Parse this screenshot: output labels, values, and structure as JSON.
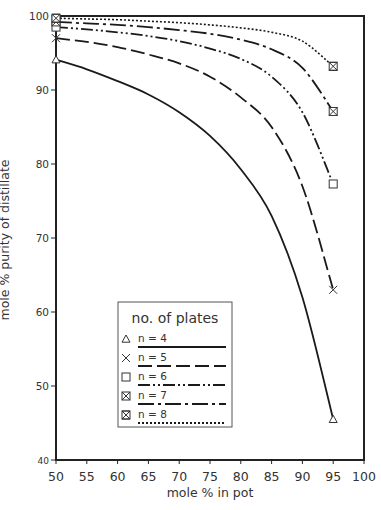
{
  "chart_data": {
    "type": "line",
    "title": "",
    "xlabel": "mole % in pot",
    "ylabel": "mole % purity of distillate",
    "xlim": [
      50,
      100
    ],
    "ylim": [
      40,
      100
    ],
    "x_ticks": [
      "50",
      "55",
      "60",
      "65",
      "70",
      "75",
      "80",
      "85",
      "90",
      "95",
      "100"
    ],
    "y_ticks": [
      "40",
      "50",
      "60",
      "70",
      "80",
      "90",
      "100"
    ],
    "grid": false,
    "legend": {
      "title": "no. of plates",
      "position": "lower-left inside"
    },
    "series": [
      {
        "name": "n = 4",
        "marker": "triangle",
        "dash": "solid",
        "x": [
          50,
          55,
          60,
          65,
          70,
          75,
          80,
          85,
          90,
          95
        ],
        "y": [
          94.1,
          92.8,
          91.2,
          89.4,
          87.0,
          83.8,
          79.3,
          73.0,
          62.0,
          45.5
        ]
      },
      {
        "name": "n = 5",
        "marker": "x",
        "dash": "long-dash",
        "x": [
          50,
          55,
          60,
          65,
          70,
          75,
          80,
          85,
          90,
          95
        ],
        "y": [
          97.0,
          96.5,
          95.8,
          94.8,
          93.6,
          91.8,
          89.0,
          85.0,
          77.0,
          63.0
        ]
      },
      {
        "name": "n = 6",
        "marker": "square",
        "dash": "dash-dot-dot",
        "x": [
          50,
          55,
          60,
          65,
          70,
          75,
          80,
          85,
          90,
          95
        ],
        "y": [
          98.5,
          98.2,
          97.8,
          97.3,
          96.6,
          95.6,
          94.2,
          91.8,
          87.0,
          77.3
        ]
      },
      {
        "name": "n = 7",
        "marker": "boxed-x",
        "dash": "dash-dot",
        "x": [
          50,
          55,
          60,
          65,
          70,
          75,
          80,
          85,
          90,
          95
        ],
        "y": [
          99.2,
          99.0,
          98.8,
          98.5,
          98.1,
          97.6,
          96.8,
          95.5,
          93.0,
          87.1
        ]
      },
      {
        "name": "n = 8",
        "marker": "hourglass-box",
        "dash": "dotted",
        "x": [
          50,
          55,
          60,
          65,
          70,
          75,
          80,
          85,
          90,
          95
        ],
        "y": [
          99.7,
          99.6,
          99.5,
          99.3,
          99.1,
          98.8,
          98.4,
          97.8,
          96.6,
          93.2
        ]
      }
    ]
  }
}
